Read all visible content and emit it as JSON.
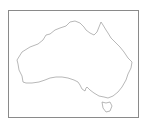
{
  "map": {
    "subject": "Australia outline",
    "stroke_color": "#9a9a9a",
    "frame_color": "#8a8a8a"
  }
}
